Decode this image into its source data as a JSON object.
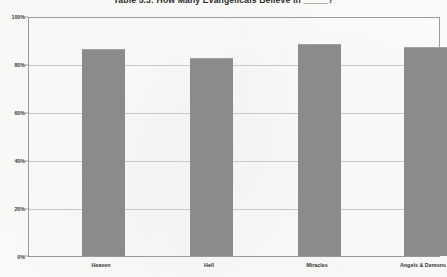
{
  "chart_data": {
    "type": "bar",
    "title": "Table 5.3: How Many Evangelicals Believe in _____?",
    "xlabel": "",
    "ylabel": "",
    "categories": [
      "Heaven",
      "Hell",
      "Miracles",
      "Angels & Demons"
    ],
    "values": [
      87,
      83,
      89,
      88
    ],
    "ylim": [
      0,
      100
    ],
    "yticks": [
      0,
      20,
      40,
      60,
      80,
      100
    ],
    "ytick_labels": [
      "0%",
      "20%",
      "40%",
      "60%",
      "80%",
      "100%"
    ],
    "grid": true,
    "legend": false,
    "series": [
      {
        "name": "Percent who believe",
        "values": [
          87,
          83,
          89,
          88
        ]
      }
    ],
    "colors": {
      "bar": "#8b8b8b",
      "grid": "#c9c9c9",
      "frame": "#9a9a9a",
      "text": "#363636",
      "background": "#fbfbfa"
    }
  }
}
